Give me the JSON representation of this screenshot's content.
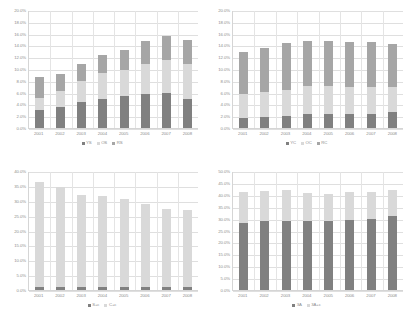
{
  "figure": {
    "layout": "2x2 grid of stacked bar charts",
    "background": "#ffffff"
  },
  "palette": {
    "dark_gray": "#808080",
    "light_gray": "#d9d9d9",
    "mid_gray": "#a6a6a6",
    "axis_text": "#8d8d8d",
    "gridline": "#dfdfdf"
  },
  "chart_data": [
    {
      "id": "top-left",
      "type": "bar",
      "stacked": true,
      "title": "",
      "xlabel": "",
      "ylabel": "",
      "categories": [
        "2001",
        "2002",
        "2003",
        "2004",
        "2005",
        "2006",
        "2007",
        "2008"
      ],
      "ylim": [
        0,
        20
      ],
      "ytick_labels": [
        "0.0%",
        "2.0%",
        "4.0%",
        "6.0%",
        "8.0%",
        "10.0%",
        "12.0%",
        "14.0%",
        "16.0%",
        "18.0%",
        "20.0%"
      ],
      "ytick_values": [
        0,
        2,
        4,
        6,
        8,
        10,
        12,
        14,
        16,
        18,
        20
      ],
      "grid": true,
      "legend_position": "bottom",
      "series": [
        {
          "name": "YS",
          "color": "#808080",
          "values": [
            3.1,
            3.5,
            4.4,
            5.0,
            5.4,
            5.8,
            6.0,
            5.0
          ]
        },
        {
          "name": "OS",
          "color": "#d9d9d9",
          "values": [
            2.0,
            2.7,
            3.6,
            4.4,
            4.4,
            5.1,
            5.6,
            5.9
          ]
        },
        {
          "name": "RS",
          "color": "#a6a6a6",
          "values": [
            3.6,
            2.9,
            2.8,
            2.9,
            3.4,
            3.8,
            4.0,
            4.0
          ]
        }
      ],
      "totals": [
        8.7,
        9.1,
        10.8,
        12.3,
        13.2,
        14.7,
        15.6,
        14.9
      ]
    },
    {
      "id": "top-right",
      "type": "bar",
      "stacked": true,
      "title": "",
      "xlabel": "",
      "ylabel": "",
      "categories": [
        "2001",
        "2002",
        "2003",
        "2004",
        "2005",
        "2006",
        "2007",
        "2008"
      ],
      "ylim": [
        0,
        20
      ],
      "ytick_labels": [
        "0.0%",
        "2.0%",
        "4.0%",
        "6.0%",
        "8.0%",
        "10.0%",
        "12.0%",
        "14.0%",
        "16.0%",
        "18.0%",
        "20.0%"
      ],
      "ytick_values": [
        0,
        2,
        4,
        6,
        8,
        10,
        12,
        14,
        16,
        18,
        20
      ],
      "grid": true,
      "legend_position": "bottom",
      "series": [
        {
          "name": "YC",
          "color": "#808080",
          "values": [
            1.7,
            1.8,
            2.0,
            2.3,
            2.3,
            2.3,
            2.4,
            2.7
          ]
        },
        {
          "name": "OC",
          "color": "#d9d9d9",
          "values": [
            4.0,
            4.3,
            4.5,
            4.8,
            4.9,
            4.7,
            4.5,
            4.3
          ]
        },
        {
          "name": "RC",
          "color": "#a6a6a6",
          "values": [
            7.2,
            7.4,
            7.9,
            7.6,
            7.6,
            7.6,
            7.7,
            7.2
          ]
        }
      ],
      "totals": [
        12.9,
        13.5,
        14.4,
        14.7,
        14.8,
        14.6,
        14.6,
        14.2
      ]
    },
    {
      "id": "bottom-left",
      "type": "bar",
      "stacked": true,
      "title": "",
      "xlabel": "",
      "ylabel": "",
      "categories": [
        "2001",
        "2002",
        "2003",
        "2004",
        "2005",
        "2006",
        "2007",
        "2008"
      ],
      "ylim": [
        0,
        40
      ],
      "ytick_labels": [
        "0.0%",
        "5.0%",
        "10.0%",
        "15.0%",
        "20.0%",
        "25.0%",
        "30.0%",
        "35.0%",
        "40.0%"
      ],
      "ytick_values": [
        0,
        5,
        10,
        15,
        20,
        25,
        30,
        35,
        40
      ],
      "grid": true,
      "legend_position": "bottom",
      "series": [
        {
          "name": "S+c",
          "color": "#808080",
          "values": [
            1.0,
            1.0,
            1.0,
            1.0,
            1.0,
            1.0,
            1.0,
            1.0
          ]
        },
        {
          "name": "C+c",
          "color": "#d9d9d9",
          "values": [
            35.2,
            33.6,
            30.8,
            30.6,
            29.5,
            28.0,
            26.2,
            25.8
          ]
        }
      ],
      "totals": [
        36.2,
        34.6,
        31.8,
        31.6,
        30.5,
        29.0,
        27.2,
        26.8
      ]
    },
    {
      "id": "bottom-right",
      "type": "bar",
      "stacked": true,
      "title": "",
      "xlabel": "",
      "ylabel": "",
      "categories": [
        "2001",
        "2002",
        "2003",
        "2004",
        "2005",
        "2006",
        "2007",
        "2008"
      ],
      "ylim": [
        0,
        50
      ],
      "ytick_labels": [
        "0.0%",
        "5.0%",
        "10.0%",
        "15.0%",
        "20.0%",
        "25.0%",
        "30.0%",
        "35.0%",
        "40.0%",
        "45.0%",
        "50.0%"
      ],
      "ytick_values": [
        0,
        5,
        10,
        15,
        20,
        25,
        30,
        35,
        40,
        45,
        50
      ],
      "grid": true,
      "legend_position": "bottom",
      "series": [
        {
          "name": "3A",
          "color": "#808080",
          "values": [
            28.2,
            28.8,
            28.8,
            29.0,
            28.9,
            29.4,
            30.0,
            31.2
          ]
        },
        {
          "name": "3A+c",
          "color": "#d9d9d9",
          "values": [
            12.9,
            12.9,
            13.1,
            11.6,
            11.3,
            11.6,
            11.0,
            10.7
          ]
        }
      ],
      "totals": [
        41.1,
        41.7,
        41.9,
        40.6,
        40.2,
        41.0,
        41.0,
        41.9
      ]
    }
  ]
}
